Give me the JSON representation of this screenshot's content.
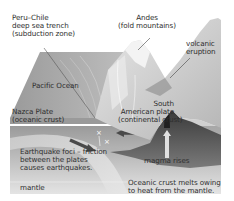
{
  "diagram": {
    "type": "subduction-zone-cross-section",
    "style": "grayscale block diagram",
    "labels": {
      "trench": [
        "Peru–Chile",
        "deep sea trench",
        "(subduction zone)"
      ],
      "andes": [
        "Andes",
        "(fold mountains)"
      ],
      "volcano": [
        "volcanic",
        "eruption"
      ],
      "pacific": "Pacific Ocean",
      "nazca": [
        "Nazca Plate",
        "(oceanic crust)"
      ],
      "south_american": [
        "South",
        "American plate",
        "(continental crust)"
      ],
      "earthquake": [
        "Earthquake foci – friction",
        "between the plates",
        "causes earthquakes."
      ],
      "magma": "magma rises",
      "mantle": "mantle",
      "melt": [
        "Oceanic crust melts owing",
        "to heat from the mantle."
      ]
    },
    "arrows": [
      {
        "name": "nazca-plate-motion",
        "direction": "right-down"
      },
      {
        "name": "south-american-plate-motion",
        "direction": "left"
      },
      {
        "name": "magma-rise",
        "direction": "up"
      }
    ],
    "markers": {
      "earthquake_foci_symbol": "×",
      "count": 2
    },
    "colors": {
      "background": "#ffffff",
      "ocean_top": "#8a8a8a",
      "land_light": "#d8d8d8",
      "crust_mid": "#a8a8a8",
      "magma_dark": "#4a4a4a",
      "mantle": "#c4c4c4",
      "text": "#333333"
    }
  }
}
